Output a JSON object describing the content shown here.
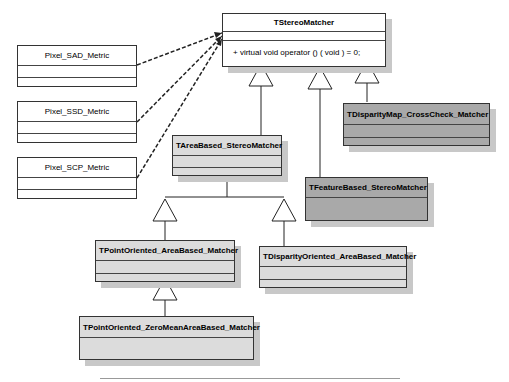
{
  "diagram": {
    "type": "UML class diagram",
    "classes": {
      "stereo_matcher": {
        "name": "TStereoMatcher",
        "operation": "+   virtual void operator () ( void ) = 0;"
      },
      "sad_metric": {
        "name": "Pixel_SAD_Metric"
      },
      "ssd_metric": {
        "name": "Pixel_SSD_Metric"
      },
      "scp_metric": {
        "name": "Pixel_SCP_Metric"
      },
      "area_based": {
        "name": "TAreaBased_StereoMatcher"
      },
      "feature_based": {
        "name": "TFeatureBased_StereoMatcher"
      },
      "crosscheck": {
        "name": "TDisparityMap_CrossCheck_Matcher"
      },
      "point_oriented": {
        "name": "TPointOriented_AreaBased_Matcher"
      },
      "disparity_oriented": {
        "name": "TDisparityOriented_AreaBased_Matcher"
      },
      "zero_mean": {
        "name": "TPointOriented_ZeroMeanAreaBased_Matcher"
      }
    },
    "relations": [
      {
        "from": "Pixel_SAD_Metric",
        "to": "TStereoMatcher",
        "kind": "dependency"
      },
      {
        "from": "Pixel_SSD_Metric",
        "to": "TStereoMatcher",
        "kind": "dependency"
      },
      {
        "from": "Pixel_SCP_Metric",
        "to": "TStereoMatcher",
        "kind": "dependency"
      },
      {
        "from": "TAreaBased_StereoMatcher",
        "to": "TStereoMatcher",
        "kind": "inheritance"
      },
      {
        "from": "TFeatureBased_StereoMatcher",
        "to": "TStereoMatcher",
        "kind": "inheritance"
      },
      {
        "from": "TDisparityMap_CrossCheck_Matcher",
        "to": "TStereoMatcher",
        "kind": "inheritance"
      },
      {
        "from": "TPointOriented_AreaBased_Matcher",
        "to": "TAreaBased_StereoMatcher",
        "kind": "inheritance"
      },
      {
        "from": "TDisparityOriented_AreaBased_Matcher",
        "to": "TAreaBased_StereoMatcher",
        "kind": "inheritance"
      },
      {
        "from": "TPointOriented_ZeroMeanAreaBased_Matcher",
        "to": "TPointOriented_AreaBased_Matcher",
        "kind": "inheritance"
      }
    ]
  }
}
